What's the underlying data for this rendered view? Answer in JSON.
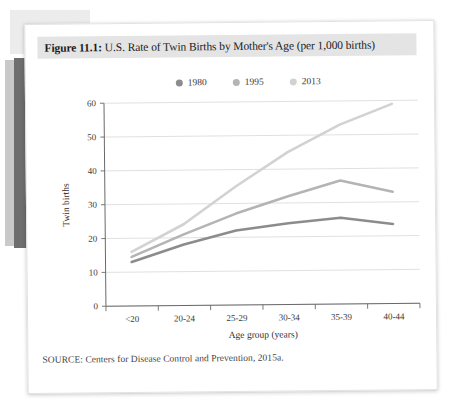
{
  "figure": {
    "label": "Figure 11.1:",
    "caption": "U.S. Rate of Twin Births by Mother's Age (per 1,000 births)",
    "source": "SOURCE: Centers for Disease Control and Prevention, 2015a."
  },
  "colors": {
    "series_1980": "#8c8c8c",
    "series_1995": "#b4b4b4",
    "series_2013": "#d2d2d2",
    "caption_band": "#e4e4e4",
    "gridline": "#d8d8d8",
    "axis": "#6a6a6a",
    "page": "#ffffff"
  },
  "chart_data": {
    "type": "line",
    "title": "U.S. Rate of Twin Births by Mother's Age (per 1,000 births)",
    "xlabel": "Age group (years)",
    "ylabel": "Twin births",
    "categories": [
      "<20",
      "20-24",
      "25-29",
      "30-34",
      "35-39",
      "40-44"
    ],
    "ylim": [
      0,
      60
    ],
    "yticks": [
      0,
      10,
      20,
      30,
      40,
      50,
      60
    ],
    "grid": true,
    "legend_position": "top-center",
    "series": [
      {
        "name": "1980",
        "values": [
          13,
          18,
          22,
          24,
          25.5,
          23.5
        ]
      },
      {
        "name": "1995",
        "values": [
          14.5,
          21,
          27,
          32,
          36.5,
          33
        ]
      },
      {
        "name": "2013",
        "values": [
          16,
          24,
          35,
          45,
          53,
          59
        ]
      }
    ]
  }
}
